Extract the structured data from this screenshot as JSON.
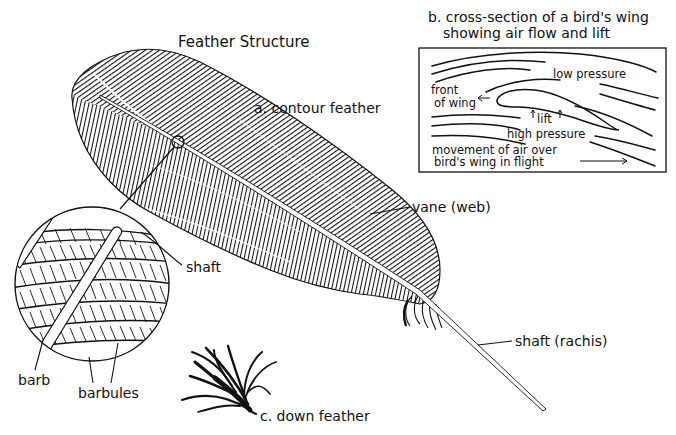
{
  "title": "Feather Structure",
  "colors": {
    "ink": "#111111",
    "paper": "#ffffff"
  },
  "labels": {
    "contour_feather": "a. contour feather",
    "vane": "vane (web)",
    "shaft_rachis": "shaft (rachis)",
    "down_feather": "c. down feather",
    "magnified_shaft": "shaft",
    "barb": "barb",
    "barbules": "barbules"
  },
  "wing_section": {
    "title_line1": "b. cross-section of a bird's wing",
    "title_line2": "showing air flow and lift",
    "low_pressure": "low pressure",
    "front_line1": "front",
    "front_line2": "of wing",
    "lift": "lift",
    "high_pressure": "high pressure",
    "movement_line1": "movement of air over",
    "movement_line2": "bird's wing in flight"
  }
}
